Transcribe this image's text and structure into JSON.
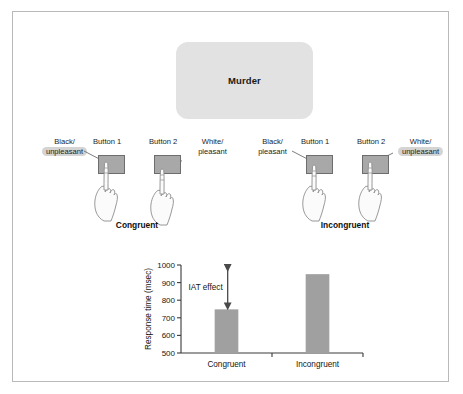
{
  "figure": {
    "stimulus": {
      "word": "Murder"
    },
    "conditions": [
      {
        "name": "congruent",
        "caption": "Congruent",
        "left_category": {
          "line1": "Black/",
          "line2": "unpleasant",
          "highlighted": true
        },
        "right_category": {
          "line1": "White/",
          "line2": "pleasant",
          "highlighted": false
        },
        "button1_label": "Button 1",
        "button2_label": "Button 2",
        "pressed_button": "Button 1"
      },
      {
        "name": "incongruent",
        "caption": "Incongruent",
        "left_category": {
          "line1": "Black/",
          "line2": "pleasant",
          "highlighted": false
        },
        "right_category": {
          "line1": "White/",
          "line2": "unpleasant",
          "highlighted": true
        },
        "button1_label": "Button 1",
        "button2_label": "Button 2",
        "pressed_button": "Button 2"
      }
    ]
  },
  "chart_data": {
    "type": "bar",
    "title": "",
    "xlabel": "",
    "ylabel": "Response time (msec)",
    "categories": [
      "Congruent",
      "Incongruent"
    ],
    "values": [
      748,
      948
    ],
    "ylim": [
      500,
      1000
    ],
    "yticks": [
      500,
      600,
      700,
      800,
      900,
      1000
    ],
    "ytick_labels": [
      "500",
      "600",
      "700",
      "800",
      "900",
      "1000"
    ],
    "grid": false,
    "legend": false,
    "bar_color": "#a0a0a0",
    "annotations": [
      {
        "label": "IAT effect",
        "type": "double-arrow",
        "from_value": 748,
        "to_value": 1000,
        "note": "vertical double-headed arrow spanning the difference between the two conditions"
      }
    ]
  },
  "colors": {
    "stimulus_box": "#e2e2e2",
    "key_face": "#a8a8a8",
    "key_border": "#6d6d6d",
    "highlight": "#d4d4d4",
    "bar": "#a0a0a0",
    "axis": "#3a3a3a",
    "frame": "#b9b9b9"
  }
}
